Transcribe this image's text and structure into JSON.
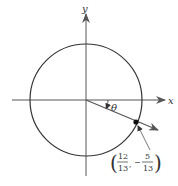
{
  "diagram": {
    "axes": {
      "x_label": "x",
      "y_label": "y"
    },
    "angle_label": "θ",
    "point": {
      "label_x_num": "12",
      "label_x_den": "13",
      "label_y_sign": "−",
      "label_y_num": "5",
      "label_y_den": "13",
      "x": 0.923,
      "y": -0.385
    },
    "colors": {
      "stroke": "#333333",
      "arrow": "#555555"
    }
  }
}
